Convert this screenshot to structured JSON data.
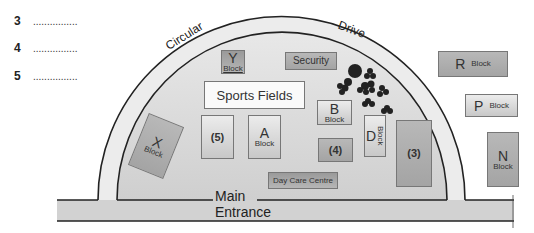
{
  "questions": [
    {
      "number": "3",
      "answer_blank": "................"
    },
    {
      "number": "4",
      "answer_blank": "................"
    },
    {
      "number": "5",
      "answer_blank": "................"
    }
  ],
  "map": {
    "road_labels": {
      "circular": "Circular",
      "drive": "Drive"
    },
    "entrance": {
      "line1": "Main",
      "line2": "Entrance"
    },
    "buildings": {
      "y_block": {
        "letter": "Y",
        "label": "Block"
      },
      "security": {
        "label": "Security"
      },
      "sports_fields": {
        "label": "Sports Fields"
      },
      "b_block": {
        "letter": "B",
        "label": "Block"
      },
      "a_block": {
        "letter": "A",
        "label": "Block"
      },
      "x_block": {
        "letter": "X",
        "label": "Block"
      },
      "d_block": {
        "letter": "D",
        "label": "Block"
      },
      "r_block": {
        "letter": "R",
        "label": "Block"
      },
      "p_block": {
        "letter": "P",
        "label": "Block"
      },
      "n_block": {
        "letter": "N",
        "label": "Block"
      },
      "day_care": {
        "label": "Day Care Centre"
      },
      "unknown_3": {
        "label": "(3)"
      },
      "unknown_4": {
        "label": "(4)"
      },
      "unknown_5": {
        "label": "(5)"
      }
    },
    "colors": {
      "ground": "#dcdcdc",
      "road": "#cfcfcf",
      "outline": "#222222",
      "block_dark": "#9a9a9a",
      "block_light": "#e6e6e6"
    }
  }
}
